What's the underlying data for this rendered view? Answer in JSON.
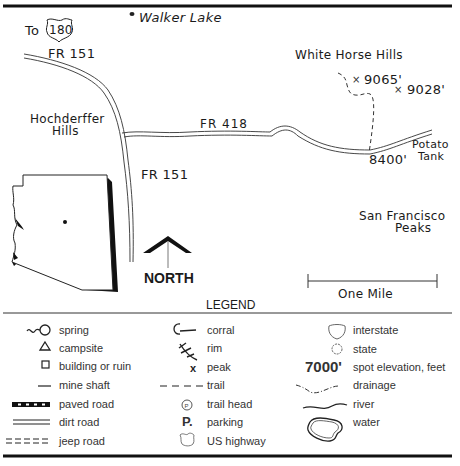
{
  "map": {
    "labels": {
      "highway_prefix": "To",
      "highway_number": "180",
      "walker_lake": "Walker Lake",
      "fr151_top": "FR 151",
      "fr151_bottom": "FR 151",
      "fr418": "FR 418",
      "hochderffer_line1": "Hochderffer",
      "hochderffer_line2": "Hills",
      "white_horse_hills": "White Horse Hills",
      "elev_9065": "9065'",
      "elev_9028": "9028'",
      "elev_8400": "8400'",
      "potato_line1": "Potato",
      "potato_line2": "Tank",
      "sf_line1": "San Francisco",
      "sf_line2": "Peaks"
    },
    "north_label": "NORTH",
    "scale_label": "One Mile"
  },
  "legend": {
    "title": "LEGEND",
    "col1": [
      {
        "icon": "spring-icon",
        "label": "spring"
      },
      {
        "icon": "campsite-icon",
        "label": "campsite"
      },
      {
        "icon": "building-icon",
        "label": "building or ruin"
      },
      {
        "icon": "mine-shaft-icon",
        "label": "mine shaft"
      },
      {
        "icon": "paved-road-icon",
        "label": "paved road"
      },
      {
        "icon": "dirt-road-icon",
        "label": "dirt road"
      },
      {
        "icon": "jeep-road-icon",
        "label": "jeep road"
      }
    ],
    "col2": [
      {
        "icon": "corral-icon",
        "label": "corral"
      },
      {
        "icon": "rim-icon",
        "label": "rim"
      },
      {
        "icon": "peak-icon",
        "label": "peak"
      },
      {
        "icon": "trail-icon",
        "label": "trail"
      },
      {
        "icon": "trail-head-icon",
        "label": "trail head"
      },
      {
        "icon": "parking-icon",
        "label": "parking",
        "glyph": "P."
      },
      {
        "icon": "us-highway-icon",
        "label": "US highway"
      }
    ],
    "col3": [
      {
        "icon": "interstate-icon",
        "label": "interstate"
      },
      {
        "icon": "state-icon",
        "label": "state"
      },
      {
        "icon": "spot-elevation-icon",
        "label": "spot elevation, feet",
        "glyph": "7000'"
      },
      {
        "icon": "drainage-icon",
        "label": "drainage"
      },
      {
        "icon": "river-icon",
        "label": "river"
      },
      {
        "icon": "water-icon",
        "label": "water"
      }
    ]
  }
}
